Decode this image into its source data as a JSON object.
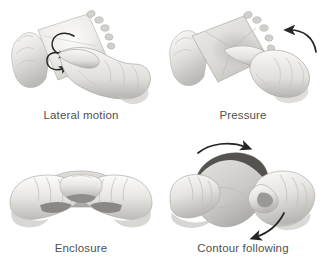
{
  "figure": {
    "background_color": "#ffffff",
    "caption_color": "#4f4f4f",
    "layout": "2x2-grid",
    "panels": [
      {
        "id": "lateral-motion",
        "caption": "Lateral motion",
        "position": "top-left",
        "illustration": "hand-rubbing-textured-plate-with-circular-arrow",
        "arrow": "circular-loop-arrow",
        "arrow_color": "#2b2b2b",
        "object": "square-textured-plate",
        "hands": 1
      },
      {
        "id": "pressure",
        "caption": "Pressure",
        "position": "top-right",
        "illustration": "hand-pressing-plate-with-curved-arrow",
        "arrow": "curved-arrow-left",
        "arrow_color": "#2b2b2b",
        "object": "square-textured-plate",
        "hands": 1
      },
      {
        "id": "enclosure",
        "caption": "Enclosure",
        "position": "bottom-left",
        "illustration": "two-hands-cupping-object",
        "arrow": "none",
        "arrow_color": "#2b2b2b",
        "object": "rounded-object",
        "hands": 2
      },
      {
        "id": "contour-following",
        "caption": "Contour following",
        "position": "bottom-right",
        "illustration": "two-hands-tracing-object-edge-with-arrows",
        "arrow": "two-curved-arrows",
        "arrow_color": "#2b2b2b",
        "object": "rounded-object-with-dark-rim",
        "hands": 2
      }
    ],
    "palette": {
      "skin_light": "#f2f1ef",
      "skin_mid": "#dedcd9",
      "skin_shadow": "#b9b7b4",
      "skin_deep": "#8e8c89",
      "object_light": "#e2e1dd",
      "object_mid": "#cac8c4",
      "object_dark": "#9b9996",
      "object_rim": "#6d6b68",
      "outline": "#a9a7a4"
    }
  }
}
